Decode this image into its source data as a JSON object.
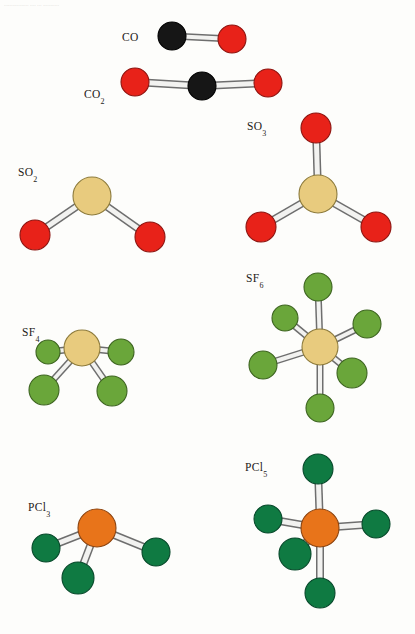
{
  "page": {
    "width": 415,
    "height": 634,
    "background": "#fdfdfb",
    "header_artifact": "................. ....  ... ..........."
  },
  "palette": {
    "carbon": "#161616",
    "carbon_edge": "#000000",
    "oxygen": "#e82219",
    "oxygen_edge": "#8d1410",
    "sulfur": "#e8cb7e",
    "sulfur_edge": "#8d7b3c",
    "fluorine": "#6aa63a",
    "fluorine_edge": "#3d6420",
    "phosphorus": "#e8741a",
    "phosphorus_edge": "#8c4410",
    "bond_fill": "#f2f2f0",
    "bond_edge": "#6e6e6e"
  },
  "molecules": [
    {
      "id": "co",
      "formula": "CO",
      "base": "CO",
      "subscript": "",
      "label_x": 122,
      "label_y": 31,
      "geometry": "linear",
      "atoms": [
        {
          "element": "C",
          "x": 172,
          "y": 36,
          "r": 14
        },
        {
          "element": "O",
          "x": 232,
          "y": 39,
          "r": 14
        }
      ],
      "bonds": [
        {
          "from": 0,
          "to": 1,
          "width": 7
        }
      ]
    },
    {
      "id": "co2",
      "formula": "CO2",
      "base": "CO",
      "subscript": "2",
      "label_x": 84,
      "label_y": 88,
      "geometry": "linear",
      "atoms": [
        {
          "element": "O",
          "x": 135,
          "y": 82,
          "r": 14
        },
        {
          "element": "C",
          "x": 202,
          "y": 86,
          "r": 14
        },
        {
          "element": "O",
          "x": 268,
          "y": 83,
          "r": 14
        }
      ],
      "bonds": [
        {
          "from": 0,
          "to": 1,
          "width": 8
        },
        {
          "from": 1,
          "to": 2,
          "width": 8
        }
      ]
    },
    {
      "id": "so2",
      "formula": "SO2",
      "base": "SO",
      "subscript": "2",
      "label_x": 18,
      "label_y": 166,
      "geometry": "bent",
      "atoms": [
        {
          "element": "S",
          "x": 92,
          "y": 196,
          "r": 19
        },
        {
          "element": "O",
          "x": 35,
          "y": 235,
          "r": 15
        },
        {
          "element": "O",
          "x": 150,
          "y": 237,
          "r": 15
        }
      ],
      "bonds": [
        {
          "from": 0,
          "to": 1,
          "width": 8
        },
        {
          "from": 0,
          "to": 2,
          "width": 8
        }
      ]
    },
    {
      "id": "so3",
      "formula": "SO3",
      "base": "SO",
      "subscript": "3",
      "label_x": 247,
      "label_y": 120,
      "geometry": "trigonal-planar",
      "atoms": [
        {
          "element": "S",
          "x": 318,
          "y": 194,
          "r": 19
        },
        {
          "element": "O",
          "x": 316,
          "y": 128,
          "r": 15
        },
        {
          "element": "O",
          "x": 261,
          "y": 227,
          "r": 15
        },
        {
          "element": "O",
          "x": 376,
          "y": 227,
          "r": 15
        }
      ],
      "bonds": [
        {
          "from": 0,
          "to": 1,
          "width": 8
        },
        {
          "from": 0,
          "to": 2,
          "width": 8
        },
        {
          "from": 0,
          "to": 3,
          "width": 8
        }
      ]
    },
    {
      "id": "sf4",
      "formula": "SF4",
      "base": "SF",
      "subscript": "4",
      "label_x": 22,
      "label_y": 326,
      "geometry": "seesaw",
      "atoms": [
        {
          "element": "S",
          "x": 82,
          "y": 348,
          "r": 18
        },
        {
          "element": "F",
          "x": 48,
          "y": 352,
          "r": 12
        },
        {
          "element": "F",
          "x": 121,
          "y": 352,
          "r": 13
        },
        {
          "element": "F",
          "x": 44,
          "y": 390,
          "r": 15
        },
        {
          "element": "F",
          "x": 112,
          "y": 391,
          "r": 15
        }
      ],
      "bonds": [
        {
          "from": 0,
          "to": 1,
          "width": 7
        },
        {
          "from": 0,
          "to": 2,
          "width": 7
        },
        {
          "from": 0,
          "to": 3,
          "width": 7
        },
        {
          "from": 0,
          "to": 4,
          "width": 7
        }
      ]
    },
    {
      "id": "sf6",
      "formula": "SF6",
      "base": "SF",
      "subscript": "6",
      "label_x": 246,
      "label_y": 272,
      "geometry": "octahedral",
      "atoms": [
        {
          "element": "S",
          "x": 320,
          "y": 347,
          "r": 18
        },
        {
          "element": "F",
          "x": 318,
          "y": 287,
          "r": 14
        },
        {
          "element": "F",
          "x": 320,
          "y": 408,
          "r": 14
        },
        {
          "element": "F",
          "x": 285,
          "y": 318,
          "r": 13
        },
        {
          "element": "F",
          "x": 367,
          "y": 324,
          "r": 14
        },
        {
          "element": "F",
          "x": 263,
          "y": 365,
          "r": 14
        },
        {
          "element": "F",
          "x": 352,
          "y": 373,
          "r": 15
        }
      ],
      "bonds": [
        {
          "from": 0,
          "to": 1,
          "width": 7
        },
        {
          "from": 0,
          "to": 2,
          "width": 7
        },
        {
          "from": 0,
          "to": 3,
          "width": 7
        },
        {
          "from": 0,
          "to": 4,
          "width": 7
        },
        {
          "from": 0,
          "to": 5,
          "width": 7
        },
        {
          "from": 0,
          "to": 6,
          "width": 7
        }
      ]
    },
    {
      "id": "pcl3",
      "formula": "PCl3",
      "base": "PCl",
      "subscript": "3",
      "label_x": 28,
      "label_y": 501,
      "geometry": "trigonal-pyramidal",
      "atoms": [
        {
          "element": "P",
          "x": 97,
          "y": 528,
          "r": 19
        },
        {
          "element": "Cl",
          "x": 46,
          "y": 548,
          "r": 14
        },
        {
          "element": "Cl",
          "x": 156,
          "y": 552,
          "r": 14
        },
        {
          "element": "Cl",
          "x": 78,
          "y": 578,
          "r": 16
        }
      ],
      "bonds": [
        {
          "from": 0,
          "to": 1,
          "width": 8
        },
        {
          "from": 0,
          "to": 2,
          "width": 8
        },
        {
          "from": 0,
          "to": 3,
          "width": 8
        }
      ]
    },
    {
      "id": "pcl5",
      "formula": "PCl5",
      "base": "PCl",
      "subscript": "5",
      "label_x": 245,
      "label_y": 461,
      "geometry": "trigonal-bipyramidal",
      "atoms": [
        {
          "element": "P",
          "x": 320,
          "y": 528,
          "r": 19
        },
        {
          "element": "Cl",
          "x": 318,
          "y": 469,
          "r": 15
        },
        {
          "element": "Cl",
          "x": 320,
          "y": 593,
          "r": 15
        },
        {
          "element": "Cl",
          "x": 268,
          "y": 519,
          "r": 14
        },
        {
          "element": "Cl",
          "x": 376,
          "y": 524,
          "r": 14
        },
        {
          "element": "Cl",
          "x": 295,
          "y": 554,
          "r": 16
        }
      ],
      "bonds": [
        {
          "from": 0,
          "to": 1,
          "width": 8
        },
        {
          "from": 0,
          "to": 2,
          "width": 8
        },
        {
          "from": 0,
          "to": 3,
          "width": 8
        },
        {
          "from": 0,
          "to": 4,
          "width": 8
        },
        {
          "from": 0,
          "to": 5,
          "width": 8
        }
      ]
    }
  ]
}
